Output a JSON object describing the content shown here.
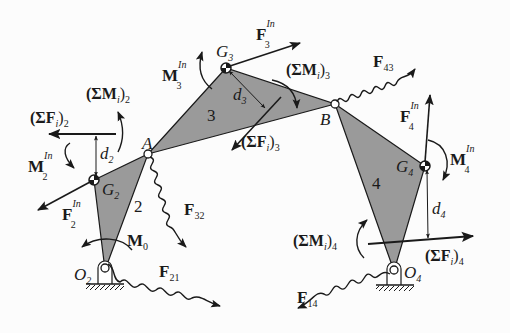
{
  "diagram": {
    "type": "four-bar linkage free-body / inertia force diagram",
    "colors": {
      "link_fill": "#9a9a9a",
      "line": "#1a1a1a",
      "background": "#fcfcfc"
    },
    "joints": {
      "O2": {
        "label": "O",
        "sub": "2",
        "x": 105,
        "y": 270
      },
      "A": {
        "label": "A",
        "x": 148,
        "y": 154
      },
      "B": {
        "label": "B",
        "x": 335,
        "y": 104
      },
      "O4": {
        "label": "O",
        "sub": "4",
        "x": 394,
        "y": 271
      },
      "G2": {
        "label": "G",
        "sub": "2",
        "x": 94,
        "y": 180
      },
      "G3": {
        "label": "G",
        "sub": "3",
        "x": 226,
        "y": 68
      },
      "G4": {
        "label": "G",
        "sub": "4",
        "x": 425,
        "y": 166
      }
    },
    "links": [
      {
        "id": "2",
        "label": "2"
      },
      {
        "id": "3",
        "label": "3"
      },
      {
        "id": "4",
        "label": "4"
      }
    ],
    "forces": {
      "F3_In": {
        "main": "F",
        "sub": "3",
        "sup": "In"
      },
      "F43": {
        "main": "F",
        "sub": "43"
      },
      "F4_In": {
        "main": "F",
        "sub": "4",
        "sup": "In"
      },
      "F2_In": {
        "main": "F",
        "sub": "2",
        "sup": "In"
      },
      "F32": {
        "main": "F",
        "sub": "32"
      },
      "F21": {
        "main": "F",
        "sub": "21"
      },
      "F14": {
        "main": "F",
        "sub": "14"
      },
      "sumF2": {
        "open": "(ΣF",
        "i": "i",
        "close": ")",
        "sub": "2"
      },
      "sumF3": {
        "open": "(ΣF",
        "i": "i",
        "close": ")",
        "sub": "3"
      },
      "sumF4": {
        "open": "(ΣF",
        "i": "i",
        "close": ")",
        "sub": "4"
      }
    },
    "moments": {
      "M3_In": {
        "main": "M",
        "sub": "3",
        "sup": "In"
      },
      "M2_In": {
        "main": "M",
        "sub": "2",
        "sup": "In"
      },
      "M4_In": {
        "main": "M",
        "sub": "4",
        "sup": "In"
      },
      "M0": {
        "main": "M",
        "sub": "0"
      },
      "sumM2": {
        "open": "(ΣM",
        "i": "i",
        "close": ")",
        "sub": "2"
      },
      "sumM3": {
        "open": "(ΣM",
        "i": "i",
        "close": ")",
        "sub": "3"
      },
      "sumM4": {
        "open": "(ΣM",
        "i": "i",
        "close": ")",
        "sub": "4"
      }
    },
    "distances": {
      "d2": {
        "main": "d",
        "sub": "2"
      },
      "d3": {
        "main": "d",
        "sub": "3"
      },
      "d4": {
        "main": "d",
        "sub": "4"
      }
    }
  }
}
